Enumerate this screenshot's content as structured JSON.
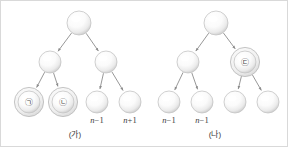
{
  "figure": {
    "background_color": "#ffffff",
    "border_color": "#d9d9d9",
    "node_fill_light": "#ffffff",
    "node_fill_dark": "#d2d2d2",
    "node_stroke": "#c4c4c4",
    "ring_stroke": "#b8b8b8",
    "arrow_color": "#8c8c8c",
    "text_color": "#3c3c3c"
  },
  "diagrams": [
    {
      "id": "tree-ga",
      "caption": "(가)",
      "caption_x": 74,
      "caption_y": 136,
      "nodes": [
        {
          "id": "ga-root",
          "cx": 78,
          "cy": 22,
          "r": 12,
          "label": "",
          "ringed": false
        },
        {
          "id": "ga-l1",
          "cx": 49,
          "cy": 61,
          "r": 11,
          "label": "",
          "ringed": false
        },
        {
          "id": "ga-r1",
          "cx": 105,
          "cy": 61,
          "r": 11,
          "label": "",
          "ringed": false
        },
        {
          "id": "ga-l2a",
          "cx": 28,
          "cy": 101,
          "r": 11,
          "label": "㉠",
          "ringed": true
        },
        {
          "id": "ga-l2b",
          "cx": 62,
          "cy": 101,
          "r": 11,
          "label": "㉡",
          "ringed": true
        },
        {
          "id": "ga-r2a",
          "cx": 96,
          "cy": 101,
          "r": 11,
          "label": "",
          "ringed": false
        },
        {
          "id": "ga-r2b",
          "cx": 129,
          "cy": 101,
          "r": 11,
          "label": "",
          "ringed": false
        }
      ],
      "edges": [
        {
          "from": "ga-root",
          "to": "ga-l1"
        },
        {
          "from": "ga-root",
          "to": "ga-r1"
        },
        {
          "from": "ga-l1",
          "to": "ga-l2a"
        },
        {
          "from": "ga-l1",
          "to": "ga-l2b"
        },
        {
          "from": "ga-r1",
          "to": "ga-r2a"
        },
        {
          "from": "ga-r1",
          "to": "ga-r2b"
        }
      ],
      "annotations": [
        {
          "id": "ga-ann-1",
          "x": 96,
          "y": 122,
          "var": "n",
          "op": "−",
          "num": "1"
        },
        {
          "id": "ga-ann-2",
          "x": 129,
          "y": 122,
          "var": "n",
          "op": "+",
          "num": "1"
        }
      ]
    },
    {
      "id": "tree-na",
      "caption": "(나)",
      "caption_x": 214,
      "caption_y": 136,
      "nodes": [
        {
          "id": "na-root",
          "cx": 215,
          "cy": 22,
          "r": 12,
          "label": "",
          "ringed": false
        },
        {
          "id": "na-l1",
          "cx": 187,
          "cy": 61,
          "r": 11,
          "label": "",
          "ringed": false
        },
        {
          "id": "na-r1",
          "cx": 244,
          "cy": 61,
          "r": 11,
          "label": "㉢",
          "ringed": true
        },
        {
          "id": "na-l2a",
          "cx": 168,
          "cy": 101,
          "r": 11,
          "label": "",
          "ringed": false
        },
        {
          "id": "na-l2b",
          "cx": 201,
          "cy": 101,
          "r": 11,
          "label": "",
          "ringed": false
        },
        {
          "id": "na-r2a",
          "cx": 234,
          "cy": 101,
          "r": 11,
          "label": "",
          "ringed": false
        },
        {
          "id": "na-r2b",
          "cx": 267,
          "cy": 101,
          "r": 11,
          "label": "",
          "ringed": false
        }
      ],
      "edges": [
        {
          "from": "na-root",
          "to": "na-l1"
        },
        {
          "from": "na-root",
          "to": "na-r1"
        },
        {
          "from": "na-l1",
          "to": "na-l2a"
        },
        {
          "from": "na-l1",
          "to": "na-l2b"
        },
        {
          "from": "na-r1",
          "to": "na-r2a"
        },
        {
          "from": "na-r1",
          "to": "na-r2b"
        }
      ],
      "annotations": [
        {
          "id": "na-ann-1",
          "x": 168,
          "y": 122,
          "var": "n",
          "op": "−",
          "num": "1"
        },
        {
          "id": "na-ann-2",
          "x": 201,
          "y": 122,
          "var": "n",
          "op": "−",
          "num": "1"
        }
      ]
    }
  ]
}
